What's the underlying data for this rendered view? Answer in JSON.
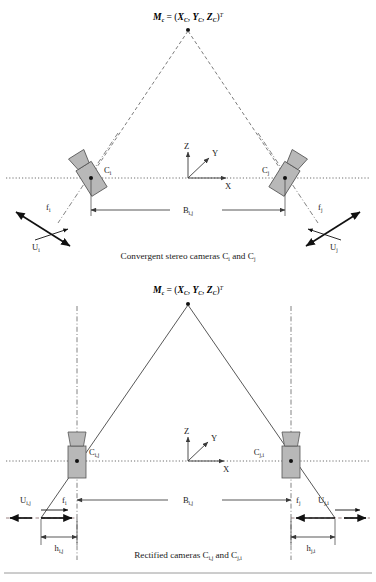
{
  "figure": {
    "background_color": "#ffffff",
    "line_color": "#3a3a3a",
    "camera_fill": "#b8b8b8",
    "camera_stroke": "#555555",
    "text_color": "#1a1a1a",
    "divider_color": "#9a9a9a"
  },
  "top_diagram": {
    "name": "convergent-stereo-diagram",
    "point_label": {
      "m": "M",
      "m_sub": "c",
      "eq": " = (",
      "x": "X",
      "x_sub": "C",
      "comma1": ", ",
      "y": "Y",
      "y_sub": "C",
      "comma2": ", ",
      "z": "Z",
      "z_sub": "C",
      "close": ")",
      "transpose": "T",
      "full": "Mc = (XC, YC, ZC)T"
    },
    "camera_left_label": "C",
    "camera_left_sub": "i",
    "camera_right_label": "C",
    "camera_right_sub": "j",
    "focal_left": "f",
    "focal_left_sub": "i",
    "focal_right": "f",
    "focal_right_sub": "j",
    "baseline": "B",
    "baseline_sub": "i,j",
    "vector_left": "U",
    "vector_left_sub": "i",
    "vector_right": "U",
    "vector_right_sub": "j",
    "axis_z": "Z",
    "axis_y": "Y",
    "axis_x": "X",
    "caption": "Convergent stereo cameras C",
    "caption_sub1": "i",
    "caption_mid": " and C",
    "caption_sub2": "j",
    "caption_full": "Convergent stereo cameras Ci and Cj"
  },
  "bottom_diagram": {
    "name": "rectified-stereo-diagram",
    "point_label": {
      "m": "M",
      "m_sub": "c",
      "eq": " = (",
      "x": "X",
      "x_sub": "C",
      "comma1": ", ",
      "y": "Y",
      "y_sub": "C",
      "comma2": ", ",
      "z": "Z",
      "z_sub": "C",
      "close": ")",
      "transpose": "T",
      "full": "Mc = (XC, YC, ZC)T"
    },
    "camera_left_label": "C",
    "camera_left_sub": "i,j",
    "camera_right_label": "C",
    "camera_right_sub": "j,i",
    "focal_left": "f",
    "focal_left_sub": "i",
    "focal_right": "f",
    "focal_right_sub": "j",
    "baseline": "B",
    "baseline_sub": "i,j",
    "vector_left": "U",
    "vector_left_sub": "i,j",
    "vector_right": "U",
    "vector_right_sub": "j,i",
    "offset_left": "h",
    "offset_left_sub": "i,j",
    "offset_right": "h",
    "offset_right_sub": "j,i",
    "axis_z": "Z",
    "axis_y": "Y",
    "axis_x": "X",
    "caption": "Rectified cameras C",
    "caption_sub1": "i,j",
    "caption_mid": " and C",
    "caption_sub2": "j,i",
    "caption_full": "Rectified cameras Ci,j and Cj,i"
  }
}
